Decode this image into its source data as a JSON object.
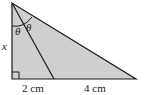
{
  "diagram": {
    "type": "right-triangle-angle-bisector",
    "fill_color": "#cfcfcf",
    "stroke_color": "#1a1a1a",
    "labels": {
      "side_left": "x",
      "angle_left": "θ",
      "angle_right": "θ",
      "segment_left": "2 cm",
      "segment_right": "4 cm"
    }
  }
}
